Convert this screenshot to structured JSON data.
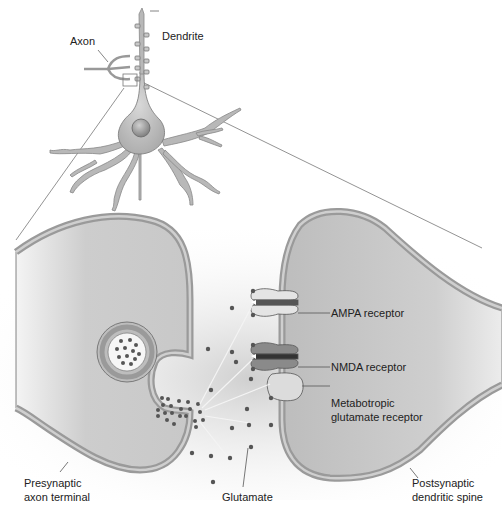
{
  "labels": {
    "axon": "Axon",
    "dendrite": "Dendrite",
    "ampa": "AMPA receptor",
    "nmda": "NMDA receptor",
    "mglur_line1": "Metabotropic",
    "mglur_line2": "glutamate receptor",
    "presynaptic_line1": "Presynaptic",
    "presynaptic_line2": "axon terminal",
    "postsynaptic_line1": "Postsynaptic",
    "postsynaptic_line2": "dendritic spine",
    "glutamate": "Glutamate"
  },
  "colors": {
    "membrane_outer": "#9a9a9a",
    "membrane_inner": "#c8c8c8",
    "cytoplasm": "#cfcfcf",
    "neurotransmitter": "#555555",
    "receptor_ampa": "#e4e4e4",
    "receptor_nmda": "#8a8a8a",
    "receptor_mglur": "#dcdcdc"
  }
}
